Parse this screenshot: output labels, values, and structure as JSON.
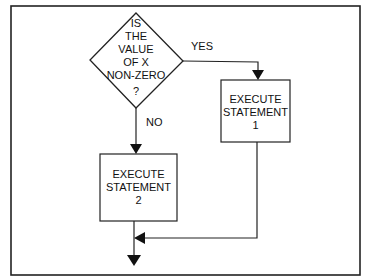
{
  "diagram": {
    "type": "flowchart",
    "decision": {
      "lines": [
        "IS",
        "THE",
        "VALUE",
        "OF X",
        "NON-ZERO",
        "?"
      ]
    },
    "edges": {
      "yes_label": "YES",
      "no_label": "NO"
    },
    "boxes": [
      {
        "id": "statement-1",
        "lines": [
          "EXECUTE",
          "STATEMENT",
          "1"
        ]
      },
      {
        "id": "statement-2",
        "lines": [
          "EXECUTE",
          "STATEMENT",
          "2"
        ]
      }
    ],
    "colors": {
      "stroke": "#222222",
      "background": "#ffffff",
      "text": "#111111"
    }
  }
}
